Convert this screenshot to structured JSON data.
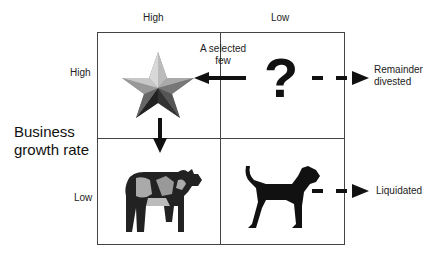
{
  "diagram": {
    "type": "BCG growth-share matrix",
    "column_headers": [
      "High",
      "Low"
    ],
    "row_axis_label": "Business growth rate",
    "row_headers": [
      "High",
      "Low"
    ],
    "quadrants": [
      {
        "position": "top-left",
        "icon": "star-icon",
        "name": "Star"
      },
      {
        "position": "top-right",
        "icon": "question-mark-icon",
        "name": "Question mark",
        "glyph": "?"
      },
      {
        "position": "bottom-left",
        "icon": "cow-icon",
        "name": "Cash cow"
      },
      {
        "position": "bottom-right",
        "icon": "dog-icon",
        "name": "Dog"
      }
    ],
    "arrows": [
      {
        "from": "question-mark",
        "to": "star",
        "label": "A selected few",
        "style": "solid"
      },
      {
        "from": "star",
        "to": "cash-cow",
        "label": "",
        "style": "solid"
      },
      {
        "from": "question-mark",
        "to": "outside",
        "label": "Remainder divested",
        "style": "dashed"
      },
      {
        "from": "dog",
        "to": "outside",
        "label": "Liquidated",
        "style": "dashed"
      }
    ],
    "labels": {
      "selected_line1": "A selected",
      "selected_line2": "few",
      "remainder_line1": "Remainder",
      "remainder_line2": "divested",
      "liquidated": "Liquidated",
      "axis_line1": "Business",
      "axis_line2": "growth rate"
    }
  }
}
